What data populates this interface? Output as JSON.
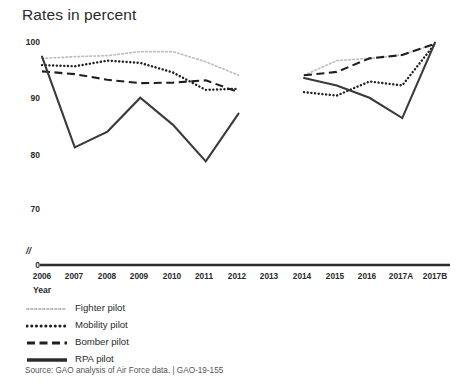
{
  "chart_data": {
    "type": "line",
    "title": "Rates in percent",
    "xlabel": "Year",
    "ylabel": "Rates in percent",
    "ylim": [
      70,
      100
    ],
    "yticks": [
      70,
      80,
      90,
      100
    ],
    "axis_break": "//",
    "axis_origin_label": "0",
    "grid": false,
    "legend_position": "below-left",
    "categories": [
      "2006",
      "2007",
      "2008",
      "2009",
      "2010",
      "2011",
      "2012",
      "2013",
      "2014",
      "2015",
      "2016",
      "2017A",
      "2017B"
    ],
    "series": [
      {
        "name": "Fighter pilot",
        "style": "light-dotted",
        "color": "#bfbfbf",
        "values": [
          97.0,
          97.3,
          97.5,
          98.2,
          98.2,
          96.4,
          94.0,
          null,
          94.0,
          96.6,
          97.0,
          97.6,
          99.6
        ]
      },
      {
        "name": "Mobility pilot",
        "style": "dotted",
        "color": "#1f1f1f",
        "values": [
          95.8,
          95.6,
          96.6,
          96.2,
          94.5,
          91.4,
          91.6,
          null,
          91.0,
          90.4,
          92.9,
          92.2,
          99.6
        ]
      },
      {
        "name": "Bomber pilot",
        "style": "dashed",
        "color": "#1f1f1f",
        "values": [
          94.7,
          94.2,
          93.2,
          92.6,
          92.7,
          93.1,
          91.0,
          null,
          94.0,
          94.6,
          97.0,
          97.6,
          99.6
        ]
      },
      {
        "name": "RPA pilot",
        "style": "solid",
        "color": "#3a3a3a",
        "values": [
          97.3,
          81.2,
          84.0,
          90.0,
          85.2,
          78.7,
          87.2,
          null,
          93.5,
          92.2,
          90.0,
          86.4,
          99.8
        ]
      }
    ]
  },
  "legend": {
    "items": [
      {
        "label": "Fighter pilot",
        "swatch": "light-dotted-line-icon"
      },
      {
        "label": "Mobility pilot",
        "swatch": "dotted-line-icon"
      },
      {
        "label": "Bomber pilot",
        "swatch": "dashed-line-icon"
      },
      {
        "label": "RPA pilot",
        "swatch": "solid-line-icon"
      }
    ]
  },
  "source": {
    "text": "Source: GAO analysis of Air Force data. | GAO-19-155"
  },
  "axis": {
    "y_labels": [
      "100",
      "90",
      "80",
      "70"
    ],
    "origin": "0",
    "break_symbol": "//",
    "x_labels": [
      "2006",
      "2007",
      "2008",
      "2009",
      "2010",
      "2011",
      "2012",
      "2013",
      "2014",
      "2015",
      "2016",
      "2017A",
      "2017B"
    ],
    "x_title": "Year"
  }
}
